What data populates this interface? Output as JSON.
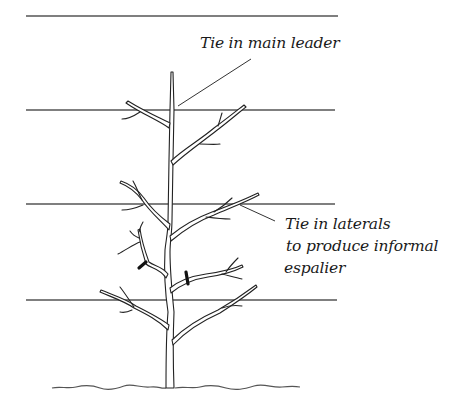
{
  "diagram": {
    "type": "horticultural-illustration",
    "labels": {
      "leader": "Tie in main leader",
      "laterals_line1": "Tie in laterals",
      "laterals_line2": "to produce informal",
      "laterals_line3": "espalier"
    },
    "wires": [
      {
        "y": 16,
        "x1": 26,
        "x2": 338
      },
      {
        "y": 110,
        "x1": 26,
        "x2": 335
      },
      {
        "y": 204,
        "x1": 26,
        "x2": 335
      },
      {
        "y": 300,
        "x1": 26,
        "x2": 337
      }
    ],
    "ties_count": 2,
    "colors": {
      "line": "#222222",
      "wire": "#555555",
      "background": "#ffffff"
    }
  }
}
